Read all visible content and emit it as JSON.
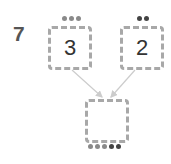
{
  "problem_number": "7",
  "left_box": {
    "value": "3",
    "dots": 3,
    "dot_color": "#8a8a8a"
  },
  "right_box": {
    "value": "2",
    "dots": 2,
    "dot_color": "#444444"
  },
  "result_box": {
    "value": "",
    "dots": [
      {
        "color": "#8a8a8a"
      },
      {
        "color": "#8a8a8a"
      },
      {
        "color": "#8a8a8a"
      },
      {
        "color": "#444444"
      },
      {
        "color": "#444444"
      }
    ]
  },
  "colors": {
    "box_border": "#a8a8a8",
    "arrow": "#cccccc",
    "number": "#555555"
  }
}
